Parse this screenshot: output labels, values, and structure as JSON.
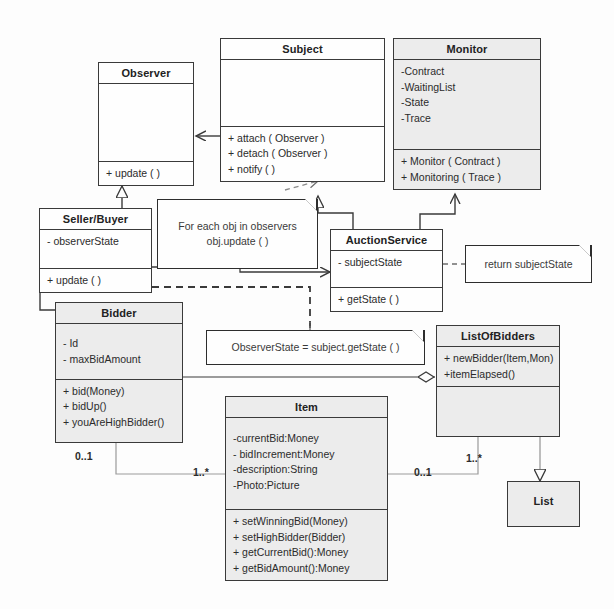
{
  "diagram": {
    "kind": "uml-class-diagram",
    "colors": {
      "class_fill": "#ececec",
      "class_fill_plain": "#fefefe",
      "stroke": "#3a3a3a",
      "background": "#fdfdfd"
    }
  },
  "classes": {
    "observer": {
      "name": "Observer",
      "attributes": [],
      "operations": [
        "+ update ( )"
      ]
    },
    "subject": {
      "name": "Subject",
      "attributes": [],
      "operations": [
        "+ attach ( Observer )",
        "+ detach ( Observer )",
        "+ notify ( )"
      ]
    },
    "monitor": {
      "name": "Monitor",
      "attributes": [
        "-Contract",
        "-WaitingList",
        "-State",
        "-Trace"
      ],
      "operations": [
        "+ Monitor ( Contract )",
        "+ Monitoring ( Trace )"
      ]
    },
    "seller_buyer": {
      "name": "Seller/Buyer",
      "attributes": [
        "- observerState"
      ],
      "operations": [
        "+ update ( )"
      ]
    },
    "auction_service": {
      "name": "AuctionService",
      "attributes": [
        "- subjectState"
      ],
      "operations": [
        "+ getState ( )"
      ]
    },
    "bidder": {
      "name": "Bidder",
      "attributes": [
        "- Id",
        "- maxBidAmount"
      ],
      "operations": [
        "+ bid(Money)",
        "+ bidUp()",
        "+ youAreHighBidder()"
      ]
    },
    "list_of_bidders": {
      "name": "ListOfBidders",
      "attributes": [
        "+ newBidder(Item,Mon)",
        "+itemElapsed()"
      ],
      "operations": []
    },
    "item": {
      "name": "Item",
      "attributes": [
        "-currentBid:Money",
        "- bidIncrement:Money",
        "-description:String",
        "-Photo:Picture"
      ],
      "operations": [
        "+ setWinningBid(Money)",
        "+ setHighBidder(Bidder)",
        "+ getCurrentBid():Money",
        "+ getBidAmount():Money"
      ]
    },
    "list": {
      "name": "List",
      "attributes": [],
      "operations": []
    }
  },
  "notes": {
    "for_each": {
      "line1": "For each obj in observers",
      "line2": "obj.update ( )"
    },
    "return_state": {
      "line1": "return subjectState"
    },
    "observer_state": {
      "line1": "ObserverState = subject.getState ( )"
    }
  },
  "multiplicities": {
    "bidder_to_item_left": "0..1",
    "bidder_to_item_right": "1..*",
    "item_to_listofbidders_left": "0..1",
    "item_to_listofbidders_right": "1..*"
  }
}
